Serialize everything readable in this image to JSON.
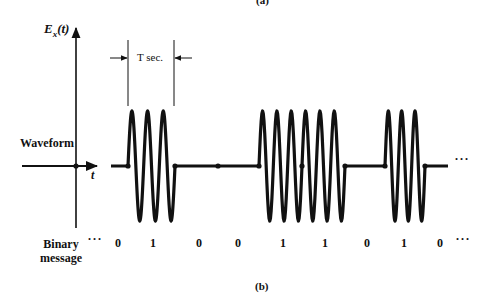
{
  "figure": {
    "caption_top": "(a)",
    "caption_bottom": "(b)",
    "y_axis_label_main": "E",
    "y_axis_label_sub": "x",
    "y_axis_label_arg": "(t)",
    "x_axis_label": "t",
    "waveform_label": "Waveform",
    "period_label": "T sec.",
    "row_label_line1": "Binary",
    "row_label_line2": "message",
    "leading_ellipsis": "···",
    "trailing_ellipsis": "···",
    "waveform_ellipsis": "···"
  },
  "signal": {
    "modulation": "on-off keying",
    "bits": [
      "0",
      "1",
      "0",
      "0",
      "1",
      "1",
      "0",
      "1",
      "0"
    ],
    "cycles_per_bit": 3,
    "bit_boundaries_px": [
      128,
      175,
      218,
      259,
      302,
      345,
      385,
      425,
      465
    ],
    "burst_segments": [
      {
        "bits": "1",
        "start_px": 128,
        "end_px": 175,
        "cycles": 3
      },
      {
        "bits": "1 1",
        "start_px": 259,
        "end_px": 345,
        "cycles": 6
      },
      {
        "bits": "1",
        "start_px": 385,
        "end_px": 425,
        "cycles": 3
      }
    ]
  },
  "bit_label_positions_px": [
    118,
    153,
    199,
    238,
    283,
    325,
    367,
    404,
    440
  ]
}
